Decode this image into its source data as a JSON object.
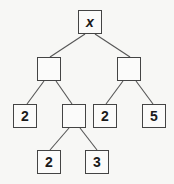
{
  "diagram": {
    "type": "tree",
    "colors": {
      "edge": "#555555",
      "border": "#444444",
      "text": "#1a1a1a",
      "background": "#f7f7f5"
    },
    "nodes": [
      {
        "id": "root",
        "label": "x",
        "x": 78,
        "y": 10
      },
      {
        "id": "left",
        "label": "",
        "x": 37,
        "y": 57
      },
      {
        "id": "right",
        "label": "",
        "x": 117,
        "y": 57
      },
      {
        "id": "left-left",
        "label": "2",
        "x": 13,
        "y": 104
      },
      {
        "id": "left-right",
        "label": "",
        "x": 62,
        "y": 104
      },
      {
        "id": "right-left",
        "label": "2",
        "x": 93,
        "y": 104
      },
      {
        "id": "right-right",
        "label": "5",
        "x": 142,
        "y": 104
      },
      {
        "id": "left-right-left",
        "label": "2",
        "x": 37,
        "y": 150
      },
      {
        "id": "left-right-right",
        "label": "3",
        "x": 85,
        "y": 150
      }
    ],
    "edges": [
      {
        "from": "root",
        "to": "left"
      },
      {
        "from": "root",
        "to": "right"
      },
      {
        "from": "left",
        "to": "left-left"
      },
      {
        "from": "left",
        "to": "left-right"
      },
      {
        "from": "right",
        "to": "right-left"
      },
      {
        "from": "right",
        "to": "right-right"
      },
      {
        "from": "left-right",
        "to": "left-right-left"
      },
      {
        "from": "left-right",
        "to": "left-right-right"
      }
    ]
  }
}
